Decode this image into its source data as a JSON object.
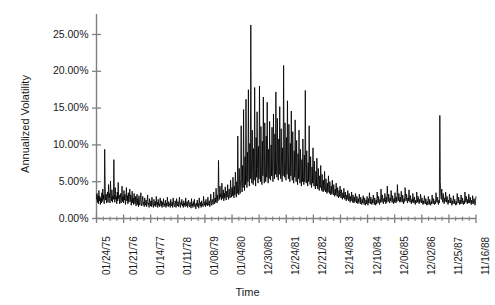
{
  "chart_data": {
    "type": "line",
    "title": "",
    "subtitle": "",
    "xlabel": "Time",
    "ylabel": "Annualized Volatility",
    "grid": false,
    "legend": false,
    "legend_position": "none",
    "line_color": "#000000",
    "axis_color": "#808080",
    "ylim": [
      0,
      28.5
    ],
    "ytick_labels": [
      "0.00%",
      "5.00%",
      "10.00%",
      "15.00%",
      "20.00%",
      "25.00%"
    ],
    "ytick_values": [
      0,
      5,
      10,
      15,
      20,
      25
    ],
    "xtick_labels": [
      "01/24/75",
      "01/21/76",
      "01/14/77",
      "01/11/78",
      "01/08/79",
      "01/04/80",
      "12/30/80",
      "12/24/81",
      "12/21/82",
      "12/14/83",
      "12/10/84",
      "12/06/85",
      "12/02/86",
      "11/25/87",
      "11/16/88"
    ],
    "minor_ticks_per_major": 4,
    "x_index_range": [
      0,
      728
    ],
    "xtick_indices": [
      0,
      52,
      104,
      156,
      208,
      260,
      312,
      364,
      416,
      468,
      520,
      572,
      624,
      676,
      728
    ],
    "series": [
      {
        "name": "Annualized Volatility",
        "values": [
          2.6,
          3.4,
          2.2,
          3.1,
          2.0,
          3.8,
          2.4,
          3.0,
          1.9,
          2.8,
          2.1,
          3.5,
          2.3,
          4.0,
          2.6,
          3.2,
          2.0,
          9.4,
          4.4,
          2.5,
          3.3,
          2.1,
          2.9,
          3.6,
          2.2,
          4.6,
          2.8,
          3.4,
          2.1,
          5.1,
          3.0,
          2.4,
          3.9,
          2.2,
          3.1,
          2.6,
          8.0,
          3.4,
          2.2,
          4.2,
          2.6,
          3.0,
          2.0,
          3.6,
          2.4,
          4.9,
          2.7,
          3.2,
          2.0,
          2.8,
          3.4,
          2.1,
          2.9,
          4.4,
          2.3,
          3.0,
          2.1,
          3.8,
          2.5,
          3.3,
          1.9,
          2.7,
          4.2,
          2.4,
          3.1,
          2.0,
          3.5,
          2.2,
          2.9,
          4.0,
          2.3,
          3.2,
          1.8,
          2.6,
          3.7,
          2.1,
          2.8,
          1.9,
          3.4,
          2.3,
          2.0,
          3.0,
          1.7,
          2.5,
          3.3,
          1.9,
          2.7,
          1.6,
          3.1,
          2.2,
          1.8,
          2.6,
          3.5,
          2.0,
          1.7,
          2.4,
          3.0,
          1.9,
          2.2,
          1.6,
          2.8,
          2.1,
          1.8,
          2.5,
          1.6,
          2.3,
          3.2,
          1.9,
          2.1,
          1.5,
          2.7,
          2.0,
          1.7,
          2.4,
          1.6,
          2.9,
          2.0,
          1.8,
          1.5,
          2.6,
          2.1,
          1.7,
          2.3,
          1.6,
          3.0,
          1.9,
          2.2,
          1.5,
          2.6,
          1.8,
          2.0,
          1.6,
          2.8,
          2.1,
          1.7,
          2.4,
          1.5,
          2.2,
          1.9,
          2.7,
          1.6,
          2.0,
          1.8,
          2.5,
          1.5,
          2.1,
          1.7,
          2.9,
          1.9,
          1.6,
          2.3,
          1.8,
          2.0,
          1.5,
          2.6,
          1.9,
          1.7,
          2.2,
          1.5,
          2.8,
          2.0,
          1.8,
          1.6,
          2.4,
          2.1,
          1.5,
          2.7,
          1.9,
          1.7,
          2.3,
          1.6,
          2.0,
          2.9,
          1.8,
          1.5,
          2.2,
          1.9,
          2.6,
          1.7,
          2.0,
          1.5,
          2.4,
          1.8,
          2.1,
          1.6,
          2.8,
          1.9,
          1.7,
          2.3,
          1.5,
          2.0,
          2.5,
          1.8,
          1.6,
          2.2,
          1.9,
          1.4,
          2.7,
          1.7,
          2.0,
          1.5,
          2.3,
          1.8,
          2.6,
          1.6,
          1.9,
          1.3,
          2.1,
          1.8,
          2.5,
          1.6,
          2.0,
          1.4,
          2.8,
          1.9,
          1.7,
          2.2,
          1.5,
          2.4,
          1.8,
          2.0,
          1.6,
          3.0,
          2.1,
          1.8,
          2.3,
          1.6,
          2.6,
          1.9,
          2.1,
          1.7,
          2.9,
          2.0,
          1.8,
          2.4,
          1.6,
          2.2,
          3.3,
          2.0,
          1.8,
          2.6,
          2.2,
          1.9,
          3.6,
          2.4,
          2.0,
          2.8,
          2.2,
          4.1,
          2.6,
          2.1,
          3.2,
          2.4,
          7.9,
          3.5,
          2.6,
          4.4,
          2.9,
          3.3,
          2.5,
          4.8,
          3.1,
          2.7,
          3.9,
          2.4,
          3.4,
          2.8,
          4.3,
          3.0,
          2.5,
          3.7,
          2.9,
          4.6,
          3.2,
          2.6,
          4.0,
          3.3,
          2.8,
          5.2,
          3.5,
          2.9,
          4.2,
          3.1,
          5.6,
          3.6,
          2.8,
          4.4,
          3.2,
          6.3,
          3.8,
          2.9,
          5.0,
          3.4,
          11.2,
          4.6,
          3.2,
          6.8,
          4.0,
          3.4,
          5.4,
          12.6,
          4.8,
          3.6,
          7.2,
          4.2,
          14.8,
          5.5,
          3.8,
          8.4,
          4.6,
          16.2,
          5.8,
          4.2,
          9.0,
          5.0,
          17.5,
          6.2,
          4.4,
          10.2,
          5.4,
          26.3,
          8.5,
          4.8,
          12.0,
          6.0,
          4.6,
          9.5,
          5.2,
          17.8,
          6.4,
          4.4,
          11.0,
          5.6,
          14.5,
          6.8,
          4.8,
          9.8,
          5.4,
          18.0,
          7.2,
          5.0,
          12.5,
          6.0,
          4.6,
          10.5,
          5.8,
          16.5,
          7.0,
          4.8,
          13.0,
          6.2,
          5.0,
          11.2,
          5.6,
          15.8,
          6.6,
          4.8,
          9.4,
          5.4,
          13.2,
          6.0,
          5.2,
          10.0,
          5.8,
          12.4,
          6.4,
          5.0,
          14.2,
          6.8,
          5.4,
          11.5,
          6.0,
          17.2,
          7.4,
          5.6,
          13.6,
          6.4,
          5.2,
          10.8,
          6.0,
          15.2,
          7.0,
          5.4,
          12.2,
          6.6,
          5.0,
          9.6,
          5.8,
          20.8,
          8.0,
          5.6,
          13.0,
          6.4,
          5.2,
          11.0,
          6.0,
          16.0,
          7.2,
          5.4,
          12.8,
          6.2,
          5.0,
          10.2,
          5.8,
          14.6,
          6.8,
          5.2,
          11.8,
          6.0,
          4.8,
          9.2,
          5.6,
          13.4,
          6.4,
          5.0,
          10.6,
          5.8,
          4.6,
          8.8,
          5.4,
          12.0,
          6.0,
          4.8,
          9.4,
          5.2,
          4.4,
          8.0,
          5.0,
          10.8,
          5.6,
          4.6,
          8.6,
          5.0,
          17.4,
          6.8,
          4.8,
          9.2,
          5.4,
          4.4,
          7.6,
          5.0,
          12.6,
          5.8,
          4.6,
          8.4,
          5.0,
          4.2,
          7.0,
          4.8,
          9.6,
          5.2,
          4.4,
          7.8,
          4.6,
          4.0,
          6.4,
          4.4,
          8.2,
          4.8,
          4.0,
          6.8,
          4.4,
          3.8,
          5.8,
          4.2,
          7.2,
          4.6,
          3.8,
          6.0,
          4.0,
          3.6,
          5.2,
          3.8,
          6.4,
          4.2,
          3.6,
          5.4,
          3.8,
          3.4,
          4.8,
          3.6,
          5.8,
          4.0,
          3.4,
          5.0,
          3.6,
          3.2,
          4.4,
          3.4,
          5.2,
          3.8,
          3.2,
          4.6,
          3.4,
          3.0,
          4.0,
          3.2,
          4.8,
          3.6,
          3.0,
          4.2,
          3.2,
          2.8,
          3.8,
          3.0,
          4.4,
          3.4,
          2.8,
          3.9,
          3.0,
          2.6,
          3.5,
          2.8,
          4.1,
          3.2,
          2.6,
          3.6,
          2.8,
          2.4,
          3.2,
          2.6,
          3.8,
          3.0,
          2.4,
          3.4,
          2.6,
          2.2,
          3.0,
          2.4,
          3.6,
          2.8,
          2.2,
          3.2,
          2.5,
          2.1,
          2.9,
          2.3,
          3.4,
          2.7,
          2.1,
          3.0,
          2.4,
          2.0,
          2.7,
          2.2,
          3.3,
          2.6,
          2.0,
          2.9,
          2.3,
          1.9,
          2.6,
          2.1,
          3.1,
          2.5,
          1.9,
          2.8,
          2.2,
          1.8,
          2.5,
          2.0,
          3.0,
          2.4,
          1.8,
          2.7,
          2.1,
          3.5,
          2.6,
          2.0,
          2.9,
          2.3,
          1.9,
          2.6,
          2.1,
          3.2,
          2.5,
          1.9,
          2.8,
          2.2,
          1.8,
          2.5,
          2.0,
          3.6,
          2.7,
          2.1,
          3.0,
          2.3,
          1.9,
          2.6,
          2.2,
          4.0,
          2.8,
          2.2,
          3.2,
          2.4,
          2.0,
          2.7,
          2.3,
          3.4,
          2.6,
          2.0,
          2.9,
          2.2,
          4.4,
          3.0,
          2.3,
          3.3,
          2.5,
          2.1,
          2.8,
          2.4,
          3.8,
          2.9,
          2.2,
          3.1,
          2.4,
          2.0,
          2.7,
          2.2,
          3.5,
          2.6,
          2.1,
          2.9,
          2.3,
          4.6,
          3.1,
          2.4,
          3.4,
          2.6,
          2.2,
          2.9,
          2.3,
          3.7,
          2.8,
          2.2,
          3.2,
          2.5,
          2.0,
          2.7,
          2.3,
          4.2,
          3.0,
          2.4,
          3.3,
          2.6,
          2.1,
          2.8,
          2.4,
          3.9,
          2.9,
          2.2,
          3.1,
          2.5,
          2.0,
          2.6,
          2.2,
          3.4,
          2.7,
          2.1,
          2.9,
          2.3,
          1.9,
          2.5,
          2.1,
          3.6,
          2.8,
          2.2,
          3.0,
          2.4,
          2.0,
          2.6,
          2.2,
          3.3,
          2.6,
          2.1,
          2.8,
          2.2,
          1.9,
          2.4,
          2.0,
          3.1,
          2.5,
          2.0,
          2.7,
          2.2,
          1.8,
          2.3,
          1.9,
          3.0,
          2.4,
          1.9,
          2.6,
          2.1,
          1.8,
          2.3,
          2.0,
          3.2,
          2.5,
          2.0,
          2.7,
          2.2,
          1.9,
          2.4,
          2.0,
          3.5,
          2.7,
          2.2,
          2.9,
          2.3,
          1.9,
          2.5,
          2.1,
          14.0,
          5.0,
          3.2,
          2.6,
          4.0,
          2.8,
          2.2,
          3.4,
          2.6,
          2.0,
          2.8,
          2.3,
          3.6,
          2.8,
          2.2,
          3.0,
          2.4,
          1.9,
          2.5,
          2.1,
          3.3,
          2.6,
          2.1,
          2.8,
          2.2,
          1.8,
          2.4,
          2.0,
          3.1,
          2.5,
          2.0,
          2.6,
          2.1,
          1.8,
          2.3,
          1.9,
          3.4,
          2.7,
          2.1,
          2.9,
          2.3,
          1.9,
          2.5,
          2.0,
          3.2,
          2.6,
          2.0,
          2.8,
          2.2,
          1.9,
          2.4,
          2.0,
          3.6,
          2.8,
          2.2,
          3.0,
          2.4,
          2.0,
          2.6,
          2.1,
          3.3,
          2.6,
          2.1,
          2.9,
          2.3,
          1.9,
          2.5,
          2.0,
          3.1,
          2.5,
          2.0,
          2.7,
          2.2,
          1.8,
          2.4,
          3.0
        ]
      }
    ]
  }
}
